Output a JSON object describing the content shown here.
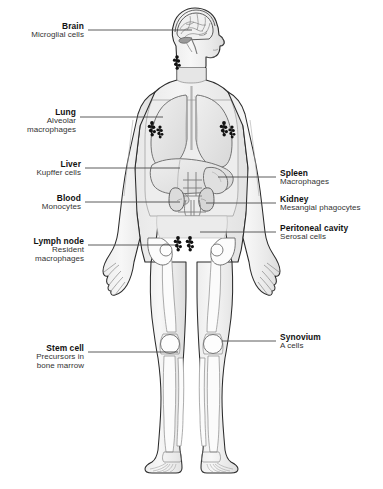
{
  "figure": {
    "orientation": "anterior view, head in right profile",
    "colors": {
      "background": "#ffffff",
      "body_fill": "#f2f2f2",
      "body_outline": "#2b2b2b",
      "organ_fill": "#e4e4e4",
      "organ_outline": "#6d6d6d",
      "lymph_node": "#111111",
      "leader_line": "#4a4a4a"
    }
  },
  "labels": [
    {
      "id": "brain",
      "title": "Brain",
      "sub": "Microglial cells",
      "side": "left",
      "target": "brain"
    },
    {
      "id": "lung",
      "title": "Lung",
      "sub": "Alveolar\nmacrophages",
      "sub_line1": "Alveolar",
      "sub_line2": "macrophages",
      "side": "left",
      "target": "lung"
    },
    {
      "id": "liver",
      "title": "Liver",
      "sub": "Kupffer cells",
      "side": "left",
      "target": "liver"
    },
    {
      "id": "blood",
      "title": "Blood",
      "sub": "Monocytes",
      "side": "left",
      "target": "blood-vessel"
    },
    {
      "id": "lymph-node",
      "title": "Lymph node",
      "sub": "Resident\nmacrophages",
      "sub_line1": "Resident",
      "sub_line2": "macrophages",
      "side": "left",
      "target": "inguinal-lymph-nodes"
    },
    {
      "id": "stem-cell",
      "title": "Stem cell",
      "sub": "Precursors in\nbone marrow",
      "sub_line1": "Precursors in",
      "sub_line2": "bone marrow",
      "side": "left",
      "target": "tibia-bone-marrow"
    },
    {
      "id": "spleen",
      "title": "Spleen",
      "sub": "Macrophages",
      "side": "right",
      "target": "spleen"
    },
    {
      "id": "kidney",
      "title": "Kidney",
      "sub": "Mesangial phagocytes",
      "side": "right",
      "target": "kidney"
    },
    {
      "id": "peritoneal-cavity",
      "title": "Peritoneal cavity",
      "sub": "Serosal cells",
      "side": "right",
      "target": "peritoneum"
    },
    {
      "id": "synovium",
      "title": "Synovium",
      "sub": "A cells",
      "side": "right",
      "target": "knee-joint"
    }
  ]
}
